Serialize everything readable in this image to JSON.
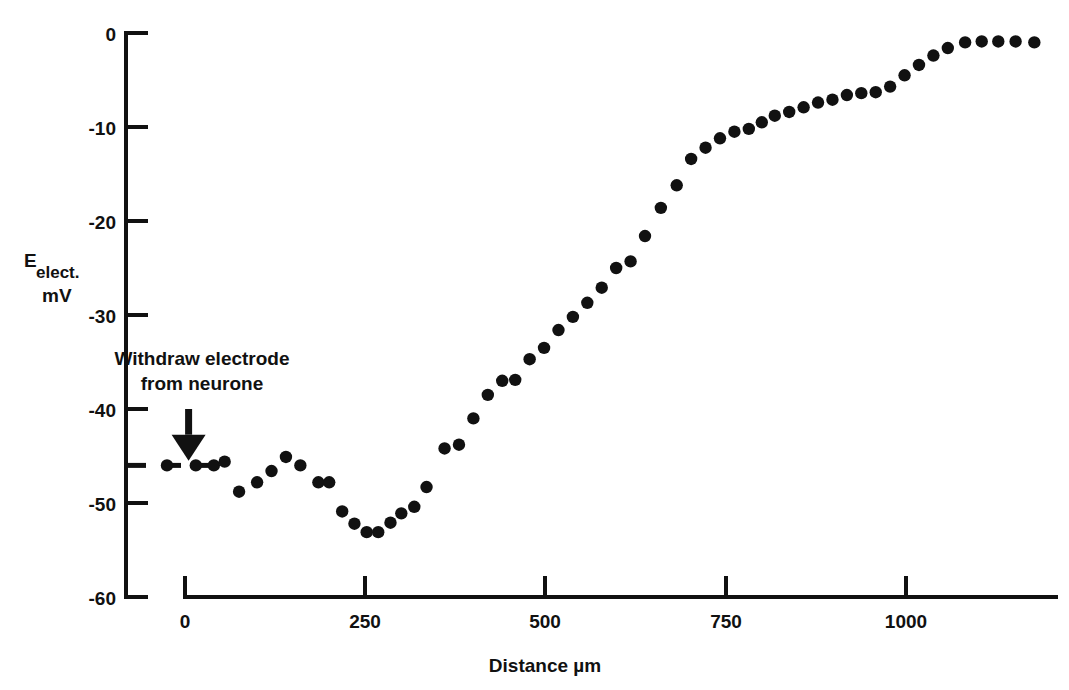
{
  "chart_data": {
    "type": "scatter",
    "title": "",
    "xlabel": "Distance  µm",
    "ylabel_main": "E",
    "ylabel_subscript": "elect.",
    "ylabel_units": "mV",
    "xlim": [
      -60,
      1210
    ],
    "ylim": [
      -60,
      0
    ],
    "xticks": [
      0,
      250,
      500,
      750,
      1000
    ],
    "xtick_labels": [
      "0",
      "250",
      "500",
      "750",
      "1000"
    ],
    "yticks": [
      0,
      -10,
      -20,
      -30,
      -40,
      -50,
      -60
    ],
    "ytick_labels": [
      "0",
      "-10",
      "-20",
      "-30",
      "-40",
      "-50",
      "-60"
    ],
    "grid": false,
    "legend": null,
    "marker": "filled-circle",
    "marker_color": "#111111",
    "baseline_mv": -46,
    "baseline_style": "dashed",
    "points": [
      {
        "x": -25,
        "y": -46.0
      },
      {
        "x": 15,
        "y": -46.0
      },
      {
        "x": 40,
        "y": -46.0
      },
      {
        "x": 55,
        "y": -45.6
      },
      {
        "x": 75,
        "y": -48.8
      },
      {
        "x": 100,
        "y": -47.8
      },
      {
        "x": 120,
        "y": -46.6
      },
      {
        "x": 140,
        "y": -45.1
      },
      {
        "x": 160,
        "y": -46.0
      },
      {
        "x": 185,
        "y": -47.8
      },
      {
        "x": 200,
        "y": -47.8
      },
      {
        "x": 218,
        "y": -50.9
      },
      {
        "x": 235,
        "y": -52.2
      },
      {
        "x": 252,
        "y": -53.1
      },
      {
        "x": 268,
        "y": -53.1
      },
      {
        "x": 285,
        "y": -52.1
      },
      {
        "x": 300,
        "y": -51.1
      },
      {
        "x": 318,
        "y": -50.4
      },
      {
        "x": 335,
        "y": -48.3
      },
      {
        "x": 360,
        "y": -44.2
      },
      {
        "x": 380,
        "y": -43.8
      },
      {
        "x": 400,
        "y": -41.0
      },
      {
        "x": 420,
        "y": -38.5
      },
      {
        "x": 440,
        "y": -37.0
      },
      {
        "x": 458,
        "y": -36.9
      },
      {
        "x": 478,
        "y": -34.7
      },
      {
        "x": 498,
        "y": -33.5
      },
      {
        "x": 518,
        "y": -31.6
      },
      {
        "x": 538,
        "y": -30.2
      },
      {
        "x": 558,
        "y": -28.7
      },
      {
        "x": 578,
        "y": -27.1
      },
      {
        "x": 598,
        "y": -25.0
      },
      {
        "x": 618,
        "y": -24.3
      },
      {
        "x": 638,
        "y": -21.6
      },
      {
        "x": 660,
        "y": -18.6
      },
      {
        "x": 682,
        "y": -16.2
      },
      {
        "x": 702,
        "y": -13.4
      },
      {
        "x": 722,
        "y": -12.2
      },
      {
        "x": 742,
        "y": -11.2
      },
      {
        "x": 762,
        "y": -10.5
      },
      {
        "x": 782,
        "y": -10.2
      },
      {
        "x": 800,
        "y": -9.5
      },
      {
        "x": 818,
        "y": -8.8
      },
      {
        "x": 838,
        "y": -8.4
      },
      {
        "x": 858,
        "y": -7.9
      },
      {
        "x": 878,
        "y": -7.4
      },
      {
        "x": 898,
        "y": -7.1
      },
      {
        "x": 918,
        "y": -6.6
      },
      {
        "x": 938,
        "y": -6.4
      },
      {
        "x": 958,
        "y": -6.3
      },
      {
        "x": 978,
        "y": -5.7
      },
      {
        "x": 998,
        "y": -4.5
      },
      {
        "x": 1018,
        "y": -3.4
      },
      {
        "x": 1038,
        "y": -2.4
      },
      {
        "x": 1058,
        "y": -1.6
      },
      {
        "x": 1082,
        "y": -1.0
      },
      {
        "x": 1105,
        "y": -0.9
      },
      {
        "x": 1128,
        "y": -0.9
      },
      {
        "x": 1152,
        "y": -0.9
      },
      {
        "x": 1178,
        "y": -1.0
      }
    ],
    "annotations": [
      {
        "name": "withdraw-electrode-annotation",
        "line1": "Withdraw electrode",
        "line2": "from neurone",
        "arrow": {
          "x": 5,
          "y_from": -40.0,
          "y_to": -45.5,
          "direction": "down"
        }
      }
    ]
  }
}
